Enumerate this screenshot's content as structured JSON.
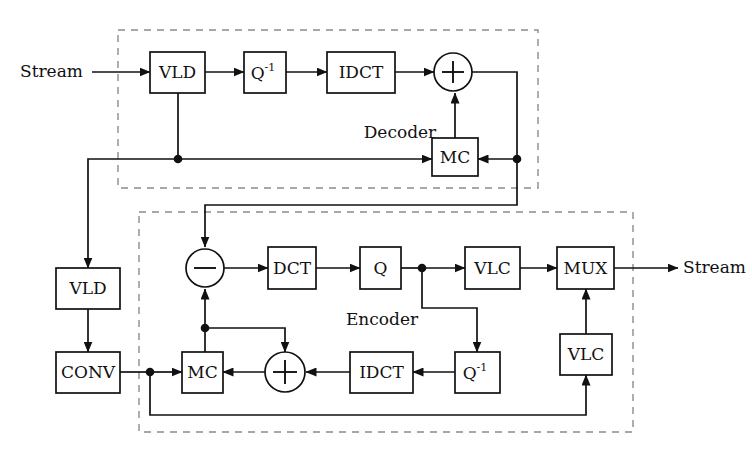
{
  "diagram": {
    "title_hidden": "",
    "groups": [
      {
        "id": "decoder",
        "label": "Decoder",
        "x": 118,
        "y": 30,
        "w": 420,
        "h": 158,
        "label_x": 400,
        "label_y": 133
      },
      {
        "id": "encoder",
        "label": "Encoder",
        "x": 139,
        "y": 212,
        "w": 494,
        "h": 220,
        "label_x": 382,
        "label_y": 320
      }
    ],
    "io": [
      {
        "id": "input-stream",
        "label": "Stream",
        "x": 20,
        "y": 72,
        "anchor": "start"
      },
      {
        "id": "output-stream",
        "label": "Stream",
        "x": 683,
        "y": 268,
        "anchor": "start"
      }
    ],
    "blocks": [
      {
        "id": "dec-vld",
        "label": "VLD",
        "sup": "",
        "x": 150,
        "y": 52,
        "w": 55,
        "h": 41
      },
      {
        "id": "dec-iq",
        "label": "Q",
        "sup": "-1",
        "x": 244,
        "y": 52,
        "w": 42,
        "h": 41
      },
      {
        "id": "dec-idct",
        "label": "IDCT",
        "sup": "",
        "x": 327,
        "y": 52,
        "w": 68,
        "h": 41
      },
      {
        "id": "dec-mc",
        "label": "MC",
        "sup": "",
        "x": 432,
        "y": 138,
        "w": 46,
        "h": 38
      },
      {
        "id": "side-vld",
        "label": "VLD",
        "sup": "",
        "x": 56,
        "y": 268,
        "w": 64,
        "h": 41
      },
      {
        "id": "side-conv",
        "label": "CONV",
        "sup": "",
        "x": 56,
        "y": 352,
        "w": 64,
        "h": 41
      },
      {
        "id": "enc-dct",
        "label": "DCT",
        "sup": "",
        "x": 268,
        "y": 247,
        "w": 48,
        "h": 42
      },
      {
        "id": "enc-q",
        "label": "Q",
        "sup": "",
        "x": 360,
        "y": 247,
        "w": 41,
        "h": 42
      },
      {
        "id": "enc-vlc1",
        "label": "VLC",
        "sup": "",
        "x": 465,
        "y": 247,
        "w": 55,
        "h": 42
      },
      {
        "id": "enc-mux",
        "label": "MUX",
        "sup": "",
        "x": 557,
        "y": 247,
        "w": 57,
        "h": 42
      },
      {
        "id": "enc-mc",
        "label": "MC",
        "sup": "",
        "x": 182,
        "y": 352,
        "w": 41,
        "h": 41
      },
      {
        "id": "enc-idct",
        "label": "IDCT",
        "sup": "",
        "x": 350,
        "y": 352,
        "w": 63,
        "h": 41
      },
      {
        "id": "enc-iq",
        "label": "Q",
        "sup": "-1",
        "x": 455,
        "y": 352,
        "w": 45,
        "h": 41
      },
      {
        "id": "enc-vlc2",
        "label": "VLC",
        "sup": "",
        "x": 560,
        "y": 334,
        "w": 52,
        "h": 41
      }
    ],
    "operators": [
      {
        "id": "dec-adder",
        "op": "+",
        "cx": 453,
        "cy": 72,
        "r": 19
      },
      {
        "id": "enc-subtractor",
        "op": "-",
        "cx": 205,
        "cy": 268,
        "r": 19
      },
      {
        "id": "enc-adder",
        "op": "+",
        "cx": 285,
        "cy": 372,
        "r": 20
      }
    ],
    "junctions": [
      {
        "id": "dec-vld-tap",
        "cx": 178,
        "cy": 159
      },
      {
        "id": "dec-recon-tap",
        "cx": 517,
        "cy": 159
      },
      {
        "id": "enc-q-tap",
        "cx": 422,
        "cy": 268
      },
      {
        "id": "enc-mc-tap",
        "cx": 205,
        "cy": 328
      },
      {
        "id": "enc-conv-tap",
        "cx": 150,
        "cy": 372
      }
    ],
    "signal_paths": [
      "input-stream -> dec-vld",
      "dec-vld -> dec-iq -> dec-idct -> dec-adder",
      "dec-vld -> dec-vld-tap -> dec-mc",
      "dec-vld-tap -> side-vld -> side-conv",
      "dec-adder -> dec-recon-tap -> dec-mc",
      "dec-mc -> dec-adder",
      "dec-recon-tap -> enc-subtractor",
      "enc-subtractor -> enc-dct -> enc-q -> enc-q-tap -> enc-vlc1 -> enc-mux -> output-stream",
      "enc-q-tap -> enc-iq -> enc-idct -> enc-adder -> enc-mc",
      "enc-mc -> enc-mc-tap -> enc-subtractor",
      "enc-mc-tap -> enc-adder",
      "side-conv -> enc-conv-tap -> enc-mc",
      "enc-conv-tap -> enc-vlc2 -> enc-mux"
    ]
  }
}
